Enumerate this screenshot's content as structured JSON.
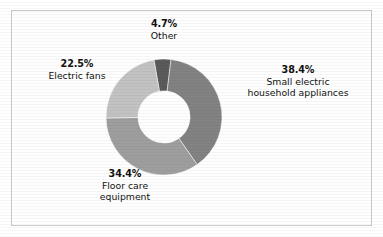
{
  "figure": {
    "frame_border_color": "#c9c9c9",
    "background_color": "#ffffff"
  },
  "chart_data": {
    "type": "pie",
    "variant": "donut",
    "title": "",
    "subtitle": "",
    "xlabel": "",
    "ylabel": "",
    "legend_position": "none",
    "grid": false,
    "units": "percent",
    "total": 100.0,
    "hole_ratio": 0.45,
    "start_angle_deg": -10,
    "direction": "clockwise",
    "categories": [
      "Other",
      "Small electric household appliances",
      "Floor care equipment",
      "Electric fans"
    ],
    "values": [
      4.7,
      38.4,
      34.4,
      22.5
    ],
    "colors": [
      "#5a5a5a",
      "#828282",
      "#9e9e9e",
      "#c2c2c2"
    ],
    "slices": [
      {
        "name": "Other",
        "value": 4.7,
        "value_label": "4.7%",
        "color": "#5a5a5a",
        "label_line1": "4.7%",
        "label_line2": "Other",
        "label_line3": ""
      },
      {
        "name": "Small electric household appliances",
        "value": 38.4,
        "value_label": "38.4%",
        "color": "#828282",
        "label_line1": "38.4%",
        "label_line2": "Small electric",
        "label_line3": "household appliances"
      },
      {
        "name": "Floor care equipment",
        "value": 34.4,
        "value_label": "34.4%",
        "color": "#9e9e9e",
        "label_line1": "34.4%",
        "label_line2": "Floor care",
        "label_line3": "equipment"
      },
      {
        "name": "Electric fans",
        "value": 22.5,
        "value_label": "22.5%",
        "color": "#c2c2c2",
        "label_line1": "22.5%",
        "label_line2": "Electric fans",
        "label_line3": ""
      }
    ]
  }
}
